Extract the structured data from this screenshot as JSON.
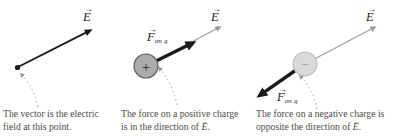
{
  "figure": {
    "description_glyphs": {
      "vec_arrow": "→"
    }
  },
  "glyphs": {
    "vec_arrow": "→"
  },
  "colors": {
    "arrow_black": "#1a1a1a",
    "field_arrow_gray": "#9b9b9b",
    "leader_dotted_gray": "#9a9a9a",
    "charge_positive_fill": "#ababab",
    "charge_positive_border": "#5d5d5d",
    "charge_negative_fill": "#d9d9d9",
    "charge_negative_border": "#bcbcbc",
    "caption_text": "#4f4b45"
  },
  "panels": [
    {
      "field_label": "E",
      "caption": {
        "line1": "The vector is the electric",
        "line2_pre": "field at this point."
      }
    },
    {
      "field_label": "E",
      "force_label": "F",
      "force_sub": "on q",
      "charge_sign": "+",
      "caption": {
        "line1": "The force on a positive charge",
        "line2_pre": "is in the direction of ",
        "line2_vec": "E",
        "line2_post": "."
      }
    },
    {
      "field_label": "E",
      "force_label": "F",
      "force_sub": "on q",
      "charge_sign": "−",
      "caption": {
        "line1": "The force on a negative charge is",
        "line2_pre": "opposite the direction of ",
        "line2_vec": "E",
        "line2_post": "."
      }
    }
  ]
}
